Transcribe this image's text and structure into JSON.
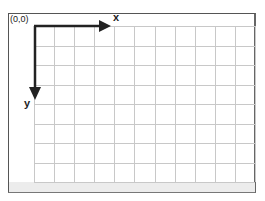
{
  "diagram": {
    "origin_label": "(0,0)",
    "x_axis_label": "x",
    "y_axis_label": "y",
    "grid": {
      "columns": 11,
      "rows": 8
    },
    "colors": {
      "grid_line": "#c8c8c8",
      "axis": "#222222",
      "frame": "#555555",
      "bottom_band": "#ececec"
    }
  }
}
